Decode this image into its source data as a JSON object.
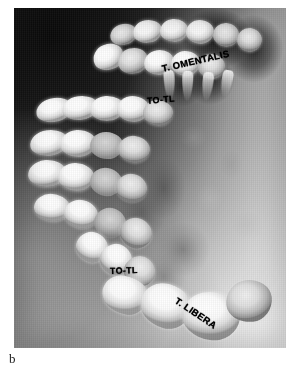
{
  "figure": {
    "panel_letter": "b",
    "image_kind": "radiograph",
    "modality": "x-ray",
    "background_color": "#ffffff"
  },
  "radiograph": {
    "alt_name": "jaw-radiograph",
    "frame": {
      "x": 14,
      "y": 8,
      "width": 272,
      "height": 340
    },
    "dark_corner": "#0a0a0a",
    "bright_corner": "#ececec"
  },
  "annotations": [
    {
      "id": "t-omentalis",
      "text": "T. OMENTALIS",
      "rotation_deg": -13,
      "x": 148,
      "y": 55
    },
    {
      "id": "to-tl-upper",
      "text": "TO-TL",
      "rotation_deg": -5,
      "x": 133,
      "y": 88
    },
    {
      "id": "to-tl-lower",
      "text": "TO-TL",
      "rotation_deg": -2,
      "x": 96,
      "y": 258
    },
    {
      "id": "t-libera",
      "text": "T. LIBERA",
      "rotation_deg": 34,
      "x": 162,
      "y": 286
    }
  ],
  "caption": {
    "letter": "b"
  }
}
